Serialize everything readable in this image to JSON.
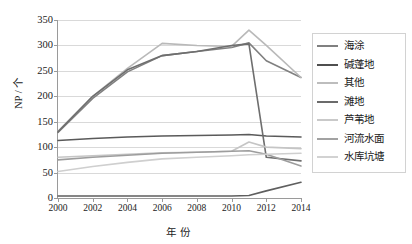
{
  "chart_data": {
    "type": "line",
    "title": "",
    "xlabel": "年份",
    "ylabel": "NP / 个",
    "x": [
      2000,
      2002,
      2004,
      2006,
      2008,
      2010,
      2011,
      2012,
      2014
    ],
    "xlim": [
      2000,
      2014
    ],
    "ylim": [
      0,
      350
    ],
    "yticks": [
      0,
      50,
      100,
      150,
      200,
      250,
      300,
      350
    ],
    "xticks": [
      2000,
      2002,
      2004,
      2006,
      2008,
      2010,
      2012,
      2014
    ],
    "grid": "horizontal",
    "legend_position": "right",
    "series": [
      {
        "name": "海涂",
        "color": "#808080",
        "values": [
          129,
          196,
          248,
          280,
          288,
          296,
          305,
          270,
          237
        ]
      },
      {
        "name": "碱蓬地",
        "color": "#5a5a5a",
        "values": [
          113,
          117,
          120,
          122,
          123,
          124,
          125,
          122,
          120
        ]
      },
      {
        "name": "其他",
        "color": "#b9b9b9",
        "values": [
          131,
          200,
          255,
          304,
          300,
          298,
          330,
          300,
          237
        ]
      },
      {
        "name": "滩地",
        "color": "#6e6e6e",
        "values": [
          130,
          200,
          252,
          280,
          288,
          300,
          303,
          80,
          73
        ]
      },
      {
        "name": "芦苇地",
        "color": "#c5c5c5",
        "values": [
          80,
          83,
          86,
          89,
          90,
          92,
          110,
          100,
          97
        ]
      },
      {
        "name": "河流水面",
        "color": "#9d9d9d",
        "values": [
          75,
          80,
          84,
          88,
          90,
          92,
          93,
          86,
          63
        ]
      },
      {
        "name": "水库坑塘",
        "color": "#cfcfcf",
        "values": [
          52,
          62,
          70,
          77,
          80,
          83,
          85,
          86,
          88
        ]
      },
      {
        "name": "底部系列",
        "color": "#5f5f5f",
        "values": [
          4,
          4,
          4,
          4,
          4,
          4,
          5,
          14,
          31
        ]
      }
    ]
  },
  "axes": {
    "y_tick_labels": [
      "0",
      "50",
      "100",
      "150",
      "200",
      "250",
      "300",
      "350"
    ],
    "x_tick_labels": [
      "2000",
      "2002",
      "2004",
      "2006",
      "2008",
      "2010",
      "2012",
      "2014"
    ],
    "y_axis_title": "NP / 个",
    "x_axis_title": "年 份"
  },
  "legend": {
    "items": [
      {
        "label": "海涂",
        "color": "#808080"
      },
      {
        "label": "碱蓬地",
        "color": "#4f4f4f"
      },
      {
        "label": "其他",
        "color": "#bdbdbd"
      },
      {
        "label": "滩地",
        "color": "#6b6b6b"
      },
      {
        "label": "芦苇地",
        "color": "#c9c9c9"
      },
      {
        "label": "河流水面",
        "color": "#a2a2a2"
      },
      {
        "label": "水库坑塘",
        "color": "#d2d2d2"
      }
    ]
  }
}
